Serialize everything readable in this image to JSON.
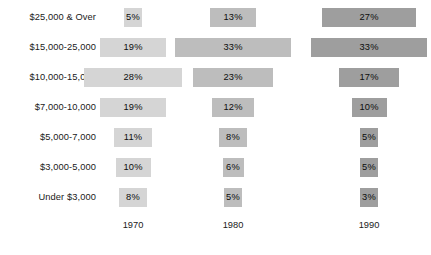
{
  "chart_data": {
    "type": "bar",
    "title": "",
    "subtitle": "",
    "xlabel": "",
    "ylabel": "",
    "orientation": "horizontal",
    "layout": "centered-bars-by-year-column",
    "grid": false,
    "legend": "none",
    "value_suffix": "%",
    "categories": [
      "$25,000 & Over",
      "$15,000-25,000",
      "$10,000-15,000",
      "$7,000-10,000",
      "$5,000-7,000",
      "$3,000-5,000",
      "Under $3,000"
    ],
    "series": [
      {
        "name": "1970",
        "color": "#d5d5d5",
        "values": [
          5,
          19,
          28,
          19,
          11,
          10,
          8
        ],
        "labels": [
          "5%",
          "19%",
          "28%",
          "19%",
          "11%",
          "10%",
          "8%"
        ]
      },
      {
        "name": "1980",
        "color": "#bdbdbd",
        "values": [
          13,
          33,
          23,
          12,
          8,
          6,
          5
        ],
        "labels": [
          "13%",
          "33%",
          "23%",
          "12%",
          "8%",
          "6%",
          "5%"
        ]
      },
      {
        "name": "1990",
        "color": "#9e9e9e",
        "values": [
          27,
          33,
          17,
          10,
          5,
          5,
          3
        ],
        "labels": [
          "27%",
          "33%",
          "17%",
          "10%",
          "5%",
          "5%",
          "3%"
        ]
      }
    ],
    "year_axis_labels": [
      "1970",
      "1980",
      "1990"
    ],
    "value_range": [
      0,
      33
    ]
  },
  "rows": [
    {
      "label": "$25,000 & Over"
    },
    {
      "label": "$15,000-25,000"
    },
    {
      "label": "$10,000-15,000"
    },
    {
      "label": "$7,000-10,000"
    },
    {
      "label": "$5,000-7,000"
    },
    {
      "label": "$3,000-5,000"
    },
    {
      "label": "Under $3,000"
    }
  ],
  "columns": [
    {
      "year": "1970"
    },
    {
      "year": "1980"
    },
    {
      "year": "1990"
    }
  ]
}
